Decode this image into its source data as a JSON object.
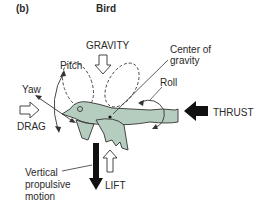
{
  "panel": {
    "label": "(b)",
    "title": "Bird"
  },
  "labels": {
    "gravity": "GRAVITY",
    "center_of_gravity_line1": "Center of",
    "center_of_gravity_line2": "gravity",
    "pitch": "Pitch",
    "yaw": "Yaw",
    "roll": "Roll",
    "drag": "DRAG",
    "thrust": "THRUST",
    "lift": "LIFT",
    "vertical_line1": "Vertical",
    "vertical_line2": "propulsive",
    "vertical_line3": "motion"
  },
  "colors": {
    "bird_fill": "#b5cdbf",
    "outline": "#2b2b2b",
    "thrust_arrow": "#111111"
  }
}
